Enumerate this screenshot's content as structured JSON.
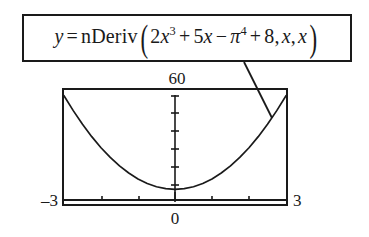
{
  "figure": {
    "background_color": "#ffffff",
    "ink_color": "#1a1a1a"
  },
  "formula_box": {
    "name": "nDeriv equation",
    "lhs": "y",
    "equals": "=",
    "function_name": "nDeriv",
    "open_paren": "(",
    "close_paren": ")",
    "terms": {
      "coef_cubic": "2",
      "var_cubic": "x",
      "exp_cubic": "3",
      "plus_1": "+",
      "coef_linear": "5",
      "var_linear": "x",
      "minus_1": "−",
      "pi": "π",
      "exp_pi": "4",
      "plus_2": "+",
      "constant": "8",
      "comma_1": ",",
      "arg_var": "x",
      "comma_2": ",",
      "arg_point": "x"
    },
    "plain_text": "y = nDeriv(2x^3 + 5x − π^4 + 8, x, x)"
  },
  "labels": {
    "y_max": "60",
    "x_min": "–3",
    "x_max": "3",
    "origin": "0"
  },
  "chart_data": {
    "type": "line",
    "title": "",
    "xlabel": "",
    "ylabel": "",
    "xlim": [
      -3,
      3
    ],
    "ylim": [
      0,
      60
    ],
    "grid": false,
    "legend": false,
    "axes_style": "calculator-window-with-tick-marks",
    "x_ticks": [
      -3,
      -2,
      -1,
      0,
      1,
      2,
      3
    ],
    "y_ticks": [
      0,
      10,
      20,
      30,
      40,
      50,
      60
    ],
    "annotations": [
      {
        "text": "60",
        "position": "above-top-center",
        "role": "y-max"
      },
      {
        "text": "–3",
        "position": "left-of-bottom-left",
        "role": "x-min"
      },
      {
        "text": "3",
        "position": "right-of-bottom-right",
        "role": "x-max"
      },
      {
        "text": "0",
        "position": "below-bottom-center",
        "role": "origin"
      }
    ],
    "leader_line": {
      "from": [
        244,
        62
      ],
      "to": [
        272,
        118
      ],
      "describes": "curve"
    },
    "series": [
      {
        "name": "y = 6x^2 + 5",
        "expression": "6x^2 + 5",
        "x": [
          -3,
          -2.75,
          -2.5,
          -2.25,
          -2,
          -1.75,
          -1.5,
          -1.25,
          -1,
          -0.75,
          -0.5,
          -0.25,
          0,
          0.25,
          0.5,
          0.75,
          1,
          1.25,
          1.5,
          1.75,
          2,
          2.25,
          2.5,
          2.75,
          3
        ],
        "values": [
          59,
          50.4,
          42.5,
          35.4,
          29,
          23.4,
          18.5,
          14.4,
          11,
          8.4,
          6.5,
          5.4,
          5,
          5.4,
          6.5,
          8.4,
          11,
          14.4,
          18.5,
          23.4,
          29,
          35.4,
          42.5,
          50.4,
          59
        ]
      }
    ]
  }
}
